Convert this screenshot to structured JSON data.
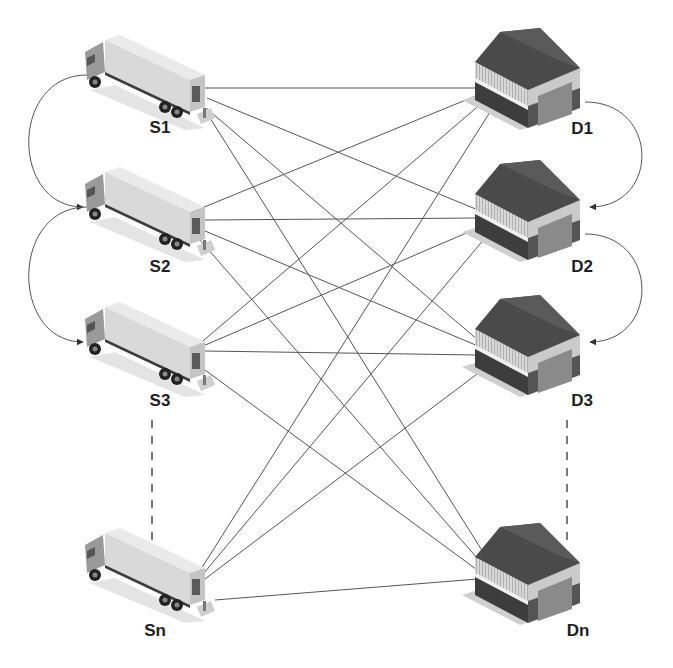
{
  "diagram": {
    "type": "bipartite-transport-network",
    "line_color": "#555555",
    "suppliers": [
      {
        "id": "S1",
        "label": "S1",
        "icon": "truck-icon",
        "x": 145,
        "y": 80,
        "label_x": 160,
        "label_y": 118,
        "anchors": [
          [
            205,
            88
          ],
          [
            207,
            98
          ],
          [
            206,
            108
          ],
          [
            210,
            118
          ]
        ]
      },
      {
        "id": "S2",
        "label": "S2",
        "icon": "truck-icon",
        "x": 145,
        "y": 212,
        "label_x": 160,
        "label_y": 257,
        "anchors": [
          [
            192,
            212
          ],
          [
            205,
            220
          ],
          [
            205,
            231
          ],
          [
            200,
            240
          ]
        ]
      },
      {
        "id": "S3",
        "label": "S3",
        "icon": "truck-icon",
        "x": 145,
        "y": 347,
        "label_x": 160,
        "label_y": 391,
        "anchors": [
          [
            190,
            352
          ],
          [
            196,
            349
          ],
          [
            205,
            351
          ],
          [
            205,
            370
          ]
        ]
      },
      {
        "id": "Sn",
        "label": "Sn",
        "icon": "truck-icon",
        "x": 145,
        "y": 573,
        "label_x": 155,
        "label_y": 621,
        "anchors": [
          [
            184,
            596
          ],
          [
            188,
            592
          ],
          [
            193,
            588
          ],
          [
            215,
            600
          ]
        ]
      }
    ],
    "destinations": [
      {
        "id": "D1",
        "label": "D1",
        "icon": "warehouse-icon",
        "x": 530,
        "y": 80,
        "label_x": 582,
        "label_y": 119,
        "anchors": [
          [
            478,
            88
          ],
          [
            478,
            95
          ],
          [
            482,
            103
          ],
          [
            490,
            112
          ]
        ]
      },
      {
        "id": "D2",
        "label": "D2",
        "icon": "warehouse-icon",
        "x": 530,
        "y": 212,
        "label_x": 582,
        "label_y": 257,
        "anchors": [
          [
            478,
            210
          ],
          [
            478,
            218
          ],
          [
            478,
            228
          ],
          [
            485,
            238
          ]
        ]
      },
      {
        "id": "D3",
        "label": "D3",
        "icon": "warehouse-icon",
        "x": 530,
        "y": 347,
        "label_x": 582,
        "label_y": 391,
        "anchors": [
          [
            478,
            340
          ],
          [
            478,
            346
          ],
          [
            478,
            355
          ],
          [
            485,
            368
          ]
        ]
      },
      {
        "id": "Dn",
        "label": "Dn",
        "icon": "warehouse-icon",
        "x": 530,
        "y": 575,
        "label_x": 578,
        "label_y": 621,
        "anchors": [
          [
            488,
            560
          ],
          [
            484,
            566
          ],
          [
            480,
            572
          ],
          [
            478,
            579
          ]
        ]
      }
    ],
    "edges_note": "every supplier connects to every destination",
    "left_loops": [
      {
        "from": "S1",
        "to": "S2"
      },
      {
        "from": "S2",
        "to": "S3"
      }
    ],
    "right_loops": [
      {
        "from": "D1",
        "to": "D2"
      },
      {
        "from": "D2",
        "to": "D3"
      }
    ],
    "ellipsis_lines": [
      {
        "side": "suppliers",
        "x": 152,
        "y1": 420,
        "y2": 545
      },
      {
        "side": "destinations",
        "x": 567,
        "y1": 420,
        "y2": 545
      }
    ]
  }
}
